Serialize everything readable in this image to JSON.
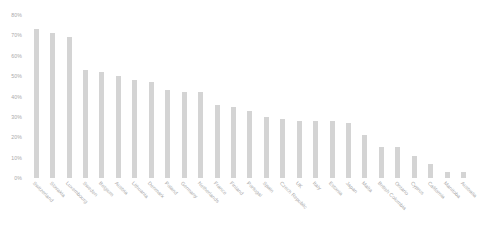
{
  "chart_data": {
    "type": "bar",
    "title": "",
    "subtitle": "",
    "xlabel": "",
    "ylabel": "",
    "ylim": [
      0,
      80
    ],
    "ytick_labels": [
      "80%",
      "70%",
      "60%",
      "50%",
      "40%",
      "30%",
      "20%",
      "10%",
      "0%"
    ],
    "ytick_values": [
      80,
      70,
      60,
      50,
      40,
      30,
      20,
      10,
      0
    ],
    "grid": false,
    "legend": false,
    "bar_color": "#d4d4d4",
    "axis_text_color": "#a9a9a9",
    "categories": [
      "Switzerland",
      "Slovakia",
      "Luxembourg",
      "Sweden",
      "Belgium",
      "Austria",
      "Lithuania",
      "Denmark",
      "Poland",
      "Germany",
      "Netherlands",
      "France",
      "Finland",
      "Portugal",
      "Spain",
      "Czech Republic",
      "UK",
      "Italy",
      "Estonia",
      "Japan",
      "Malta",
      "British Columbia",
      "Ontario",
      "Cyprus",
      "California",
      "Manitoba",
      "Australia"
    ],
    "values": [
      73,
      71,
      69,
      53,
      52,
      50,
      48,
      47,
      43,
      42,
      42,
      36,
      35,
      33,
      30,
      29,
      28,
      28,
      28,
      27,
      21,
      15,
      15,
      11,
      7,
      3,
      3
    ],
    "value_suffix": "%"
  }
}
